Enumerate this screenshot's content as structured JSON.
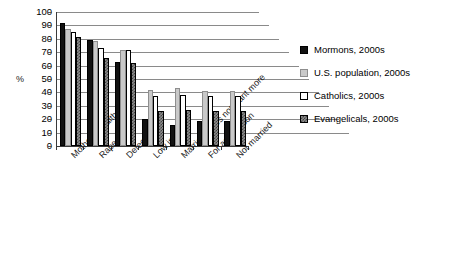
{
  "chart_data": {
    "type": "bar",
    "title": "",
    "subtitle": "",
    "xlabel": "",
    "ylabel": "%",
    "ylim": [
      0,
      100
    ],
    "ytick_step": 10,
    "yticks": [
      100,
      90,
      80,
      70,
      60,
      50,
      40,
      30,
      20,
      10,
      0
    ],
    "grid": true,
    "grid_orientation": "horizontal",
    "legend_position": "right",
    "categories": [
      "Mother's health",
      "Rape",
      "Defect",
      "Low income",
      "Married, does not want more",
      "For any reason",
      "Not married"
    ],
    "series": [
      {
        "name": "Mormons, 2000s",
        "color": "#121212",
        "pattern": "solid-black",
        "values": [
          92,
          79,
          63,
          20,
          16,
          19,
          19
        ]
      },
      {
        "name": "U.S. population, 2000s",
        "color": "#c9c9c9",
        "pattern": "solid-light-gray",
        "values": [
          87,
          78,
          72,
          42,
          43,
          41,
          41
        ]
      },
      {
        "name": "Catholics, 2000s",
        "color": "#ffffff",
        "pattern": "outline-white",
        "values": [
          85,
          73,
          72,
          37,
          38,
          37,
          37
        ]
      },
      {
        "name": "Evangelicals, 2000s",
        "color": "#8d8d8d",
        "pattern": "checkered-dark-gray",
        "values": [
          81,
          66,
          62,
          26,
          27,
          26,
          26
        ]
      }
    ]
  },
  "legend": {
    "items": [
      {
        "label": "Mormons, 2000s",
        "swatch": "legend-swatch-mormons"
      },
      {
        "label": "U.S. population, 2000s",
        "swatch": "legend-swatch-us-population"
      },
      {
        "label": "Catholics, 2000s",
        "swatch": "legend-swatch-catholics"
      },
      {
        "label": "Evangelicals, 2000s",
        "swatch": "legend-swatch-evangelicals"
      }
    ]
  }
}
